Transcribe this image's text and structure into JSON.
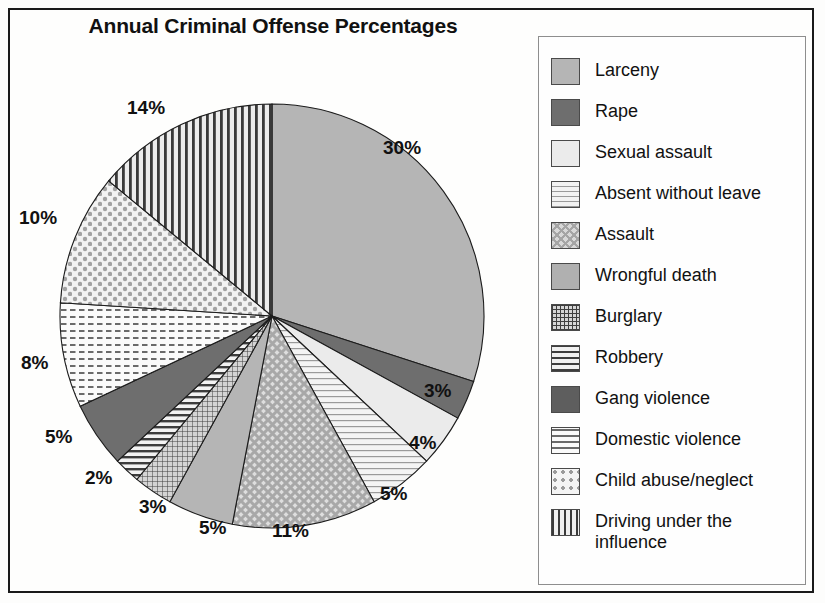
{
  "chart_title": "Annual Criminal Offense Percentages",
  "chart_data": {
    "type": "pie",
    "title": "Annual Criminal Offense Percentages",
    "xlabel": "",
    "ylabel": "",
    "legend_position": "right",
    "grid": false,
    "value_suffix": "%",
    "categories": [
      "Larceny",
      "Rape",
      "Sexual assault",
      "Absent without leave",
      "Assault",
      "Wrongful death",
      "Burglary",
      "Robbery",
      "Gang violence",
      "Domestic violence",
      "Child abuse/neglect",
      "Driving under the influence"
    ],
    "values": [
      30,
      3,
      4,
      5,
      11,
      5,
      3,
      2,
      5,
      8,
      10,
      14
    ],
    "slice_labels": [
      "30%",
      "3%",
      "4%",
      "5%",
      "11%",
      "5%",
      "3%",
      "2%",
      "5%",
      "8%",
      "10%",
      "14%"
    ],
    "fills": [
      "solid-mid",
      "solid-dark",
      "solid-light",
      "fine-horizontal-lines",
      "diagonal-cross-hatch",
      "solid-mid",
      "fine-grid",
      "horizontal-stripes",
      "solid-dark",
      "dash-pattern",
      "dot-grid",
      "vertical-stripes"
    ],
    "colors": [
      "#b5b5b5",
      "#6e6e6e",
      "#ebebeb",
      "#f2f2f2",
      "#d8d8d8",
      "#b0b0b0",
      "#d6d6d6",
      "#f0f0f0",
      "#5e5e5e",
      "#fafafa",
      "#f4f4f4",
      "#efefef"
    ]
  },
  "legend": {
    "items": [
      {
        "label": "Larceny",
        "value": "30%",
        "swatch": "sw-solid-mid"
      },
      {
        "label": "Rape",
        "value": "3%",
        "swatch": "sw-solid-dark"
      },
      {
        "label": "Sexual assault",
        "value": "4%",
        "swatch": "sw-solid-light"
      },
      {
        "label": "Absent without leave",
        "value": "5%",
        "swatch": "sw-fineline"
      },
      {
        "label": "Assault",
        "value": "11%",
        "swatch": "sw-diag-check"
      },
      {
        "label": "Wrongful death",
        "value": "5%",
        "swatch": "sw-solid-mid2"
      },
      {
        "label": "Burglary",
        "value": "3%",
        "swatch": "sw-grid"
      },
      {
        "label": "Robbery",
        "value": "2%",
        "swatch": "sw-hstripe"
      },
      {
        "label": "Gang violence",
        "value": "5%",
        "swatch": "sw-dark"
      },
      {
        "label": "Domestic violence",
        "value": "8%",
        "swatch": "sw-dash"
      },
      {
        "label": "Child abuse/neglect",
        "value": "10%",
        "swatch": "sw-dot"
      },
      {
        "label": "Driving under the influence",
        "value": "14%",
        "swatch": "sw-vstripe"
      }
    ]
  },
  "pie_labels": [
    {
      "text": "30%",
      "left": 383,
      "top": 137
    },
    {
      "text": "3%",
      "left": 424,
      "top": 380
    },
    {
      "text": "4%",
      "left": 409,
      "top": 432
    },
    {
      "text": "5%",
      "left": 380,
      "top": 483
    },
    {
      "text": "11%",
      "left": 272,
      "top": 520
    },
    {
      "text": "5%",
      "left": 199,
      "top": 517
    },
    {
      "text": "3%",
      "left": 139,
      "top": 496
    },
    {
      "text": "2%",
      "left": 85,
      "top": 467
    },
    {
      "text": "5%",
      "left": 45,
      "top": 426
    },
    {
      "text": "8%",
      "left": 21,
      "top": 352
    },
    {
      "text": "10%",
      "left": 19,
      "top": 207
    },
    {
      "text": "14%",
      "left": 127,
      "top": 97
    }
  ]
}
